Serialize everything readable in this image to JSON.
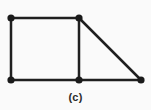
{
  "figure": {
    "caption": "(c)",
    "background_color": "#fafafa",
    "edge_color": "#1f1f1f",
    "vertex_color": "#1a1a1a",
    "edge_width": 2.5,
    "vertex_radius": 3.6,
    "width": 151,
    "height": 110
  },
  "chart_data": {
    "type": "diagram",
    "title": "(c)",
    "nodes": [
      {
        "id": "A",
        "label": "",
        "x": 11,
        "y": 18
      },
      {
        "id": "B",
        "label": "",
        "x": 79,
        "y": 18
      },
      {
        "id": "C",
        "label": "",
        "x": 11,
        "y": 80
      },
      {
        "id": "D",
        "label": "",
        "x": 79,
        "y": 80
      },
      {
        "id": "E",
        "label": "",
        "x": 141,
        "y": 80
      }
    ],
    "edges": [
      {
        "from": "A",
        "to": "B",
        "name": "top-edge"
      },
      {
        "from": "A",
        "to": "C",
        "name": "left-edge"
      },
      {
        "from": "B",
        "to": "D",
        "name": "middle-vertical-edge"
      },
      {
        "from": "C",
        "to": "D",
        "name": "bottom-left-edge"
      },
      {
        "from": "D",
        "to": "E",
        "name": "bottom-right-edge"
      },
      {
        "from": "B",
        "to": "E",
        "name": "diagonal-hypotenuse-edge"
      }
    ],
    "node_count": 5,
    "edge_count": 6,
    "xlabel": "",
    "ylabel": "",
    "grid": false,
    "legend": false
  }
}
